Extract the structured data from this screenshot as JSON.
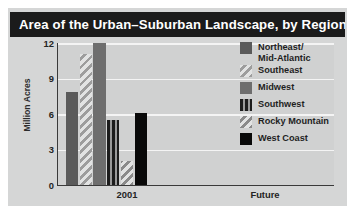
{
  "chart_data": {
    "type": "bar",
    "title": "Area of the Urban–Suburban Landscape, by Region",
    "xlabel": "",
    "ylabel": "Million Acres",
    "categories": [
      "2001",
      "Future"
    ],
    "ylim": [
      0,
      12
    ],
    "yticks": [
      0,
      3,
      6,
      9,
      12
    ],
    "ytick_labels": [
      "0",
      "3",
      "6",
      "9",
      "12"
    ],
    "grid": "horizontal",
    "legend_position": "right",
    "series": [
      {
        "name": "Northeast/\nMid-Atlantic",
        "legend_label": "Northeast/\nMid-Atlantic",
        "pattern": "solid",
        "color": "#5a5a5a",
        "values": [
          7.9,
          null
        ]
      },
      {
        "name": "Southeast",
        "legend_label": "Southeast",
        "pattern": "diagonal-hatch",
        "color": "#9d9d9d",
        "values": [
          11.1,
          null
        ]
      },
      {
        "name": "Midwest",
        "legend_label": "Midwest",
        "pattern": "solid",
        "color": "#6e6e6e",
        "values": [
          12.0,
          null
        ]
      },
      {
        "name": "Southwest",
        "legend_label": "Southwest",
        "pattern": "vertical-stripe",
        "color": "#1c1c1c",
        "values": [
          5.5,
          null
        ]
      },
      {
        "name": "Rocky Mountain",
        "legend_label": "Rocky Mountain",
        "pattern": "diagonal-hatch",
        "color": "#8a8a8a",
        "values": [
          2.0,
          null
        ]
      },
      {
        "name": "West Coast",
        "legend_label": "West Coast",
        "pattern": "solid",
        "color": "#090909",
        "values": [
          6.1,
          null
        ]
      }
    ]
  },
  "colors": {
    "page_background": "#ffffff",
    "panel_background": "#d5d6d6",
    "plot_background": "#d0d1d1",
    "title_bar_background": "#1b1b1b",
    "title_text": "#ffffff",
    "gridline": "#f4f4f4",
    "axis_line": "#3a3a3a",
    "tick_text": "#242424"
  }
}
